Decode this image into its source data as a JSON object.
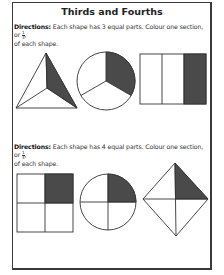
{
  "worksheet": {
    "title": "Thirds and Fourths",
    "section1": {
      "label": "Directions:",
      "text": " Each shape has 3 equal parts. Colour one section, or ",
      "fraction": {
        "numerator": "1",
        "denominator": "3"
      },
      "text_after": ",",
      "line2": "of each shape.",
      "shapes": [
        {
          "type": "triangle",
          "parts": 3,
          "shaded": 1
        },
        {
          "type": "circle",
          "parts": 3,
          "shaded": 1
        },
        {
          "type": "rectangle",
          "parts": 3,
          "shaded": 1
        }
      ]
    },
    "section2": {
      "label": "Directions:",
      "text": " Each shape has 4 equal parts. Colour one section, or ",
      "fraction": {
        "numerator": "1",
        "denominator": "4"
      },
      "text_after": ",",
      "line2": "of  each shape.",
      "shapes": [
        {
          "type": "square",
          "parts": 4,
          "shaded": 1
        },
        {
          "type": "circle",
          "parts": 4,
          "shaded": 1
        },
        {
          "type": "diamond",
          "parts": 4,
          "shaded": 1
        }
      ]
    },
    "colors": {
      "shade": "#4a4a4a",
      "line": "#333333",
      "border": "#3a3a3a"
    }
  }
}
